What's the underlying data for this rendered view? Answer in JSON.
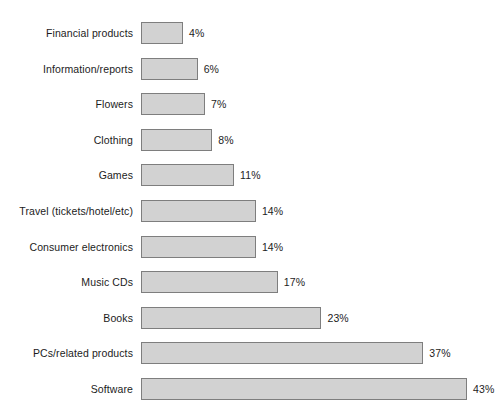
{
  "chart_data": {
    "type": "bar",
    "orientation": "horizontal",
    "title": "",
    "subtitle": "",
    "xlabel": "",
    "ylabel": "",
    "grid": false,
    "legend": null,
    "axis_visible": false,
    "xlim": [
      0,
      43
    ],
    "value_suffix": "%",
    "categories": [
      "Financial products",
      "Information/reports",
      "Flowers",
      "Clothing",
      "Games",
      "Travel (tickets/hotel/etc)",
      "Consumer electronics",
      "Music CDs",
      "Books",
      "PCs/related products",
      "Software"
    ],
    "values": [
      4,
      6,
      7,
      8,
      11,
      14,
      14,
      17,
      23,
      37,
      43
    ],
    "value_labels": [
      "4%",
      "6%",
      "7%",
      "8%",
      "11%",
      "14%",
      "14%",
      "17%",
      "23%",
      "37%",
      "43%"
    ],
    "bar_fill_color": "#d2d2d2",
    "bar_border_color": "#7e7e7e",
    "text_color": "#1c1c1c",
    "background_color": "#ffffff"
  }
}
